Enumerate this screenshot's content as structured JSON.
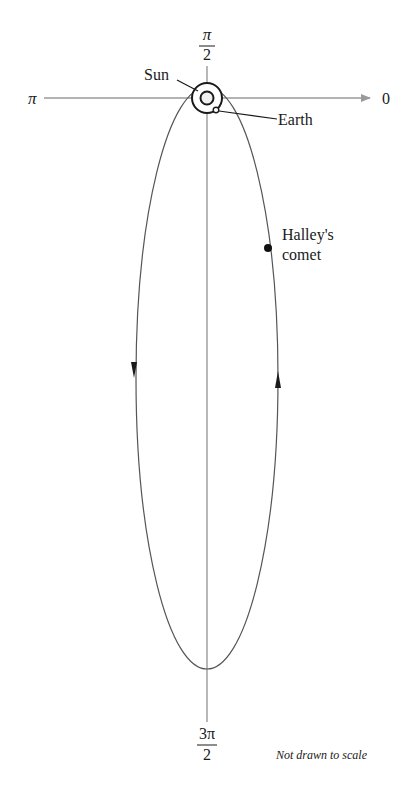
{
  "diagram": {
    "type": "polar-orbit-diagram",
    "axis_labels": {
      "angle_0": "0",
      "angle_pi_over_2_num": "π",
      "angle_pi_over_2_den": "2",
      "angle_pi": "π",
      "angle_3pi_over_2_num": "3π",
      "angle_3pi_over_2_den": "2"
    },
    "labels": {
      "sun": "Sun",
      "earth": "Earth",
      "comet_line1": "Halley's",
      "comet_line2": "comet"
    },
    "note": "Not drawn to scale",
    "colors": {
      "axis": "#9a9a9a",
      "orbit": "#555555",
      "ink": "#1a1a1a"
    }
  }
}
